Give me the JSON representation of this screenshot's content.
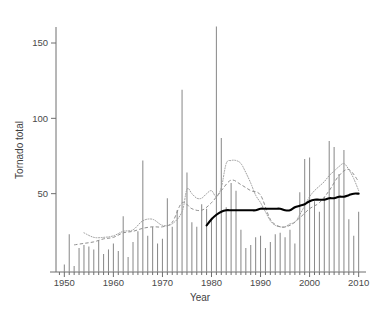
{
  "chart_data": {
    "type": "bar",
    "title": "",
    "xlabel": "Year",
    "ylabel": "Tornado total",
    "xlim": [
      1948,
      2011
    ],
    "ylim": [
      0,
      170
    ],
    "xticks": [
      1950,
      1960,
      1970,
      1980,
      1990,
      2000,
      2010
    ],
    "xtick_labels": [
      "1950",
      "1960",
      "1970",
      "1980",
      "1990",
      "2000",
      "2010"
    ],
    "yticks": [
      50,
      100,
      150
    ],
    "ytick_labels": [
      "50",
      "100",
      "150"
    ],
    "minor_xtick_interval": 1,
    "grid": false,
    "legend": "none",
    "bar_color": "#8c8c8c",
    "x": [
      1950,
      1951,
      1952,
      1953,
      1954,
      1955,
      1956,
      1957,
      1958,
      1959,
      1960,
      1961,
      1962,
      1963,
      1964,
      1965,
      1966,
      1967,
      1968,
      1969,
      1970,
      1971,
      1972,
      1973,
      1974,
      1975,
      1976,
      1977,
      1978,
      1979,
      1980,
      1981,
      1982,
      1983,
      1984,
      1985,
      1986,
      1987,
      1988,
      1989,
      1990,
      1991,
      1992,
      1993,
      1994,
      1995,
      1996,
      1997,
      1998,
      1999,
      2000,
      2001,
      2002,
      2003,
      2004,
      2005,
      2006,
      2007,
      2008,
      2009,
      2010
    ],
    "values": [
      3,
      23,
      2,
      14,
      16,
      15,
      13,
      19,
      10,
      13,
      17,
      12,
      35,
      8,
      18,
      25,
      72,
      22,
      28,
      17,
      20,
      47,
      28,
      39,
      119,
      64,
      31,
      28,
      43,
      40,
      34,
      161,
      87,
      41,
      57,
      52,
      26,
      14,
      16,
      21,
      22,
      14,
      18,
      23,
      24,
      21,
      26,
      17,
      51,
      73,
      74,
      45,
      38,
      48,
      85,
      81,
      63,
      79,
      33,
      22,
      38
    ],
    "series": [
      {
        "name": "dotted-trend",
        "style": "dotted",
        "color": "#9a9a9a",
        "x": [
          1954,
          1956,
          1958,
          1960,
          1962,
          1964,
          1966,
          1968,
          1970,
          1972,
          1974,
          1975,
          1976,
          1977,
          1978,
          1979,
          1980,
          1981,
          1982,
          1983,
          1984,
          1985,
          1986,
          1987,
          1988,
          1989,
          1990,
          1991,
          1992,
          1993,
          1994,
          1995,
          1996,
          1997,
          1998,
          1999,
          2000,
          2001,
          2002,
          2003,
          2004,
          2005,
          2006,
          2007,
          2008,
          2009,
          2010
        ],
        "values": [
          24,
          21,
          21,
          22,
          25,
          26,
          32,
          33,
          29,
          30,
          38,
          53,
          50,
          47,
          47,
          50,
          52,
          48,
          54,
          70,
          72,
          72,
          70,
          64,
          57,
          49,
          44,
          38,
          32,
          29,
          28,
          28,
          30,
          31,
          36,
          42,
          48,
          52,
          55,
          58,
          62,
          65,
          68,
          70,
          66,
          60,
          52
        ]
      },
      {
        "name": "dashed-trend",
        "style": "dashed",
        "color": "#8f8f8f",
        "x": [
          1952,
          1954,
          1956,
          1958,
          1960,
          1962,
          1964,
          1966,
          1968,
          1970,
          1972,
          1974,
          1976,
          1978,
          1980,
          1982,
          1984,
          1986,
          1988,
          1990,
          1992,
          1994,
          1996,
          1998,
          2000,
          2002,
          2004,
          2006,
          2008,
          2010
        ],
        "values": [
          16,
          17,
          18,
          20,
          21,
          24,
          25,
          27,
          28,
          28,
          31,
          44,
          40,
          39,
          44,
          52,
          59,
          56,
          52,
          49,
          33,
          28,
          29,
          34,
          40,
          44,
          52,
          62,
          66,
          58
        ]
      },
      {
        "name": "solid-trend",
        "style": "solid",
        "color": "#000000",
        "x": [
          1979,
          1980,
          1981,
          1982,
          1983,
          1984,
          1985,
          1986,
          1987,
          1988,
          1989,
          1990,
          1991,
          1992,
          1993,
          1994,
          1995,
          1996,
          1997,
          1998,
          1999,
          2000,
          2001,
          2002,
          2003,
          2004,
          2005,
          2006,
          2007,
          2008,
          2009,
          2010
        ],
        "values": [
          29,
          33,
          36,
          38,
          39,
          39,
          39,
          39,
          39,
          39,
          39,
          40,
          40,
          40,
          40,
          40,
          39,
          39,
          41,
          42,
          43,
          45,
          46,
          46,
          46,
          47,
          47,
          48,
          48,
          49,
          50,
          50
        ]
      }
    ]
  },
  "caption": {
    "text": ""
  }
}
